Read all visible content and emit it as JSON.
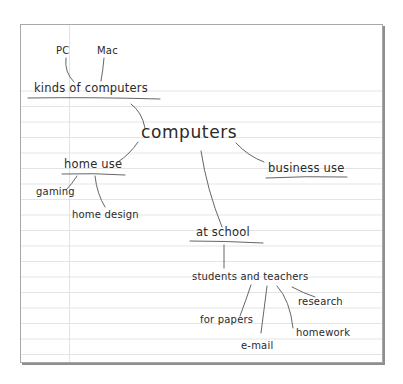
{
  "map": {
    "central": "computers",
    "nodes": {
      "pc": "PC",
      "mac": "Mac",
      "kinds": "kinds of computers",
      "home_use": "home use",
      "gaming": "gaming",
      "home_design": "home design",
      "business_use": "business use",
      "at_school": "at school",
      "students_teachers": "students and teachers",
      "research": "research",
      "for_papers": "for papers",
      "homework": "homework",
      "email": "e-mail"
    }
  },
  "colors": {
    "ink": "#2a2a2a",
    "rule": "#e4e4e4",
    "underline": "#555555",
    "border": "#a8a8a8"
  }
}
